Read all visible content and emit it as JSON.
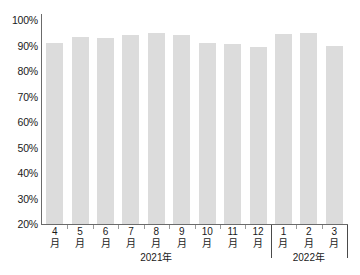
{
  "chart_data": {
    "type": "bar",
    "title": "",
    "subtitle": "",
    "xlabel": "",
    "ylabel": "",
    "ylim": [
      20,
      100
    ],
    "ytick_step": 10,
    "grid": false,
    "legend": "none",
    "bar_color": "#dcdcdc",
    "axis_color": "#6b6b6b",
    "text_color": "#1a1a1a",
    "ytick_labels": [
      "100%",
      "90%",
      "80%",
      "70%",
      "60%",
      "50%",
      "40%",
      "30%",
      "20%"
    ],
    "ytick_values": [
      100,
      90,
      80,
      70,
      60,
      50,
      40,
      30,
      20
    ],
    "categories": [
      "4月",
      "5月",
      "6月",
      "7月",
      "8月",
      "9月",
      "10月",
      "11月",
      "12月",
      "1月",
      "2月",
      "3月"
    ],
    "category_parts": [
      {
        "num": "4",
        "unit": "月"
      },
      {
        "num": "5",
        "unit": "月"
      },
      {
        "num": "6",
        "unit": "月"
      },
      {
        "num": "7",
        "unit": "月"
      },
      {
        "num": "8",
        "unit": "月"
      },
      {
        "num": "9",
        "unit": "月"
      },
      {
        "num": "10",
        "unit": "月"
      },
      {
        "num": "11",
        "unit": "月"
      },
      {
        "num": "12",
        "unit": "月"
      },
      {
        "num": "1",
        "unit": "月"
      },
      {
        "num": "2",
        "unit": "月"
      },
      {
        "num": "3",
        "unit": "月"
      }
    ],
    "values": [
      91,
      93.5,
      93,
      94,
      95,
      94,
      91,
      90.5,
      89.5,
      94.5,
      95,
      90
    ],
    "group_labels": [
      "2021年",
      "2022年"
    ],
    "groups": [
      {
        "label": "2021年",
        "start_index": 0,
        "end_index": 8
      },
      {
        "label": "2022年",
        "start_index": 9,
        "end_index": 11
      }
    ]
  }
}
